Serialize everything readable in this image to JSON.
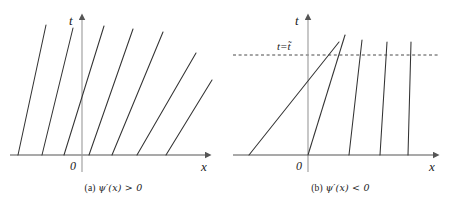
{
  "figure": {
    "background": "#ffffff",
    "line_color": "#333333",
    "axis_color": "#555555"
  },
  "panels": [
    {
      "id": "panel-a",
      "caption_index": "(a)",
      "caption_expr": "ψ′(x) > 0",
      "caption_full": "(a) ψ′(x) > 0",
      "axis": {
        "x_label": "x",
        "t_label": "t",
        "origin_label": "0",
        "origin_px": {
          "x": 82,
          "y": 155
        },
        "x_axis_from": 10,
        "x_axis_to": 212,
        "t_axis_top": 14
      },
      "characteristics": {
        "description": "fanning-out straight characteristic lines, slopes decrease left-to-right",
        "count": 7,
        "lines": [
          {
            "x_foot": 18,
            "x_top": 46,
            "y_top": 25
          },
          {
            "x_foot": 42,
            "x_top": 73,
            "y_top": 28
          },
          {
            "x_foot": 64,
            "x_top": 104,
            "y_top": 26
          },
          {
            "x_foot": 89,
            "x_top": 133,
            "y_top": 29
          },
          {
            "x_foot": 112,
            "x_top": 163,
            "y_top": 32
          },
          {
            "x_foot": 137,
            "x_top": 196,
            "y_top": 53
          },
          {
            "x_foot": 166,
            "x_top": 212,
            "y_top": 80
          }
        ]
      }
    },
    {
      "id": "panel-b",
      "caption_index": "(b)",
      "caption_expr": "ψ′(x) < 0",
      "caption_full": "(b) ψ′(x) < 0",
      "axis": {
        "x_label": "x",
        "t_label": "t",
        "origin_label": "0",
        "origin_px": {
          "x": 81,
          "y": 155
        },
        "x_axis_from": 6,
        "x_axis_to": 213,
        "t_axis_top": 14
      },
      "breaking_time": {
        "label": "t=t̃",
        "label_plain": "t = t~",
        "dashed_line_y": 55,
        "dashed_from": 6,
        "dashed_to": 213,
        "style": "dashed"
      },
      "characteristics": {
        "description": "converging straight characteristic lines crossing near t = t-tilde",
        "count": 5,
        "lines": [
          {
            "x_foot": 22,
            "x_top": 112,
            "y_top": 42
          },
          {
            "x_foot": 81,
            "x_top": 118,
            "y_top": 35
          },
          {
            "x_foot": 122,
            "x_top": 135,
            "y_top": 40
          },
          {
            "x_foot": 153,
            "x_top": 160,
            "y_top": 42
          },
          {
            "x_foot": 181,
            "x_top": 184,
            "y_top": 42
          }
        ]
      }
    }
  ]
}
